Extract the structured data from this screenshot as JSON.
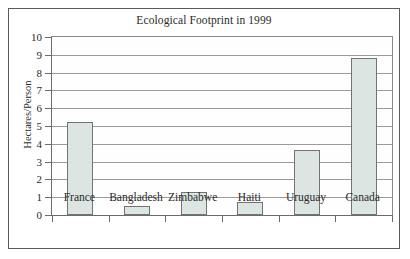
{
  "chart_data": {
    "type": "bar",
    "title": "Ecological Footprint in 1999",
    "xlabel": "",
    "ylabel": "Hectares/Person",
    "categories": [
      "France",
      "Bangladesh",
      "Zimbabwe",
      "Haiti",
      "Uruguay",
      "Canada"
    ],
    "values": [
      5.2,
      0.5,
      1.3,
      0.75,
      3.65,
      8.8
    ],
    "ylim": [
      0,
      10
    ],
    "ytick_labels": [
      "0",
      "1",
      "2",
      "3",
      "4",
      "5",
      "6",
      "7",
      "8",
      "9",
      "10"
    ],
    "ytick_values": [
      0,
      1,
      2,
      3,
      4,
      5,
      6,
      7,
      8,
      9,
      10
    ],
    "grid": true,
    "legend": false,
    "bar_fill_color": "#dbe5e1",
    "bar_border_color": "#737373",
    "gridline_color": "#9a9a9a",
    "axis_color": "#6b6b6b",
    "frame_color": "#5a5a5a",
    "background_color": "#ffffff"
  }
}
